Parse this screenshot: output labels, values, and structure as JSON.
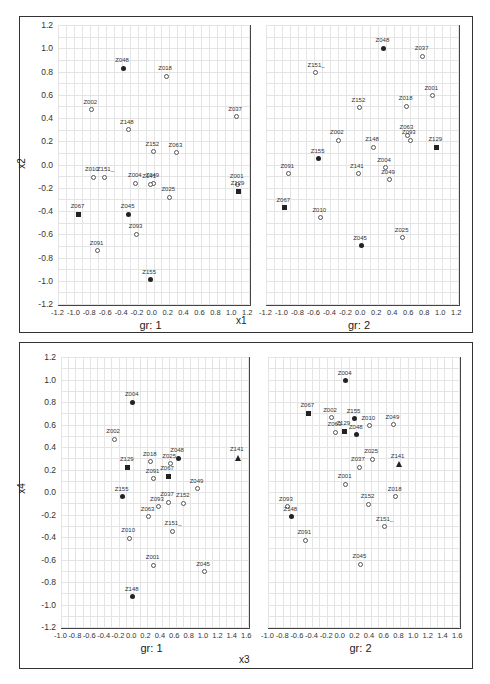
{
  "chart_data": [
    {
      "type": "scatter",
      "title": "",
      "xlabel": "x1",
      "ylabel": "x2",
      "grid": true,
      "panels": [
        {
          "label": "gr: 1",
          "xlim": [
            -1.2,
            1.2
          ],
          "ylim": [
            -1.2,
            1.2
          ],
          "xticks": [
            "-1.2",
            "-1.0",
            "-0.8",
            "-0.6",
            "-0.4",
            "-0.2",
            "0.0",
            "0.2",
            "0.4",
            "0.6",
            "0.8",
            "1.0",
            "1.2"
          ],
          "yticks": [
            "1.2",
            "1.0",
            "0.8",
            "0.6",
            "0.4",
            "0.2",
            "0.0",
            "-0.2",
            "-0.4",
            "-0.6",
            "-0.8",
            "-1.0",
            "-1.2"
          ],
          "points": [
            {
              "name": "Z048",
              "x": -0.38,
              "y": 0.83,
              "marker": "filled"
            },
            {
              "name": "Z018",
              "x": 0.16,
              "y": 0.76,
              "marker": "open"
            },
            {
              "name": "Z002",
              "x": -0.78,
              "y": 0.47,
              "marker": "open"
            },
            {
              "name": "Z037",
              "x": 1.04,
              "y": 0.41,
              "marker": "open"
            },
            {
              "name": "Z148",
              "x": -0.32,
              "y": 0.3,
              "marker": "open"
            },
            {
              "name": "Z152",
              "x": 0.0,
              "y": 0.11,
              "marker": "open"
            },
            {
              "name": "Z063",
              "x": 0.29,
              "y": 0.1,
              "marker": "open"
            },
            {
              "name": "Z010",
              "x": -0.76,
              "y": -0.11,
              "marker": "open"
            },
            {
              "name": "Z151_",
              "x": -0.61,
              "y": -0.11,
              "marker": "open"
            },
            {
              "name": "Z004",
              "x": -0.22,
              "y": -0.16,
              "marker": "open"
            },
            {
              "name": "Z049",
              "x": 0.0,
              "y": -0.16,
              "marker": "open"
            },
            {
              "name": "Z141",
              "x": -0.04,
              "y": -0.17,
              "marker": "open"
            },
            {
              "name": "Z025",
              "x": 0.2,
              "y": -0.28,
              "marker": "open"
            },
            {
              "name": "Z001",
              "x": 1.06,
              "y": -0.17,
              "marker": "open"
            },
            {
              "name": "Z129",
              "x": 1.07,
              "y": -0.23,
              "marker": "square"
            },
            {
              "name": "Z067",
              "x": -0.94,
              "y": -0.43,
              "marker": "square"
            },
            {
              "name": "Z045",
              "x": -0.31,
              "y": -0.43,
              "marker": "filled"
            },
            {
              "name": "Z093",
              "x": -0.21,
              "y": -0.6,
              "marker": "open"
            },
            {
              "name": "Z091",
              "x": -0.7,
              "y": -0.74,
              "marker": "open"
            },
            {
              "name": "Z155",
              "x": -0.04,
              "y": -0.99,
              "marker": "filled"
            }
          ]
        },
        {
          "label": "gr: 2",
          "xlim": [
            -1.2,
            1.2
          ],
          "ylim": [
            -1.2,
            1.2
          ],
          "xticks": [
            "-1.2",
            "-1.0",
            "-0.8",
            "-0.6",
            "-0.4",
            "-0.2",
            "0.0",
            "0.2",
            "0.4",
            "0.6",
            "0.8",
            "1.0",
            "1.2"
          ],
          "points": [
            {
              "name": "Z048",
              "x": 0.27,
              "y": 1.0,
              "marker": "filled"
            },
            {
              "name": "Z037",
              "x": 0.76,
              "y": 0.93,
              "marker": "open"
            },
            {
              "name": "Z151_",
              "x": -0.58,
              "y": 0.79,
              "marker": "open"
            },
            {
              "name": "Z001",
              "x": 0.88,
              "y": 0.59,
              "marker": "open"
            },
            {
              "name": "Z152",
              "x": -0.03,
              "y": 0.49,
              "marker": "open"
            },
            {
              "name": "Z018",
              "x": 0.56,
              "y": 0.5,
              "marker": "open"
            },
            {
              "name": "Z063",
              "x": 0.57,
              "y": 0.25,
              "marker": "open"
            },
            {
              "name": "Z093",
              "x": 0.6,
              "y": 0.21,
              "marker": "open"
            },
            {
              "name": "Z002",
              "x": -0.3,
              "y": 0.21,
              "marker": "open"
            },
            {
              "name": "Z148",
              "x": 0.14,
              "y": 0.15,
              "marker": "open"
            },
            {
              "name": "Z129",
              "x": 0.93,
              "y": 0.15,
              "marker": "square"
            },
            {
              "name": "Z155",
              "x": -0.54,
              "y": 0.05,
              "marker": "filled"
            },
            {
              "name": "Z091",
              "x": -0.92,
              "y": -0.08,
              "marker": "open"
            },
            {
              "name": "Z141",
              "x": -0.05,
              "y": -0.08,
              "marker": "open"
            },
            {
              "name": "Z004",
              "x": 0.29,
              "y": -0.03,
              "marker": "open"
            },
            {
              "name": "Z049",
              "x": 0.34,
              "y": -0.13,
              "marker": "open"
            },
            {
              "name": "Z067",
              "x": -0.97,
              "y": -0.37,
              "marker": "square"
            },
            {
              "name": "Z010",
              "x": -0.52,
              "y": -0.46,
              "marker": "open"
            },
            {
              "name": "Z025",
              "x": 0.51,
              "y": -0.63,
              "marker": "open"
            },
            {
              "name": "Z045",
              "x": -0.01,
              "y": -0.7,
              "marker": "filled"
            }
          ]
        }
      ]
    },
    {
      "type": "scatter",
      "title": "",
      "xlabel": "x3",
      "ylabel": "x4",
      "grid": true,
      "panels": [
        {
          "label": "gr: 1",
          "xlim": [
            -1.0,
            1.6
          ],
          "ylim": [
            -1.2,
            1.2
          ],
          "xticks": [
            "-1.0",
            "-0.8",
            "-0.6",
            "-0.4",
            "-0.2",
            "0.0",
            "0.2",
            "0.4",
            "0.6",
            "0.8",
            "1.0",
            "1.2",
            "1.4",
            "1.6"
          ],
          "yticks": [
            "1.2",
            "1.0",
            "0.8",
            "0.6",
            "0.4",
            "0.2",
            "0.0",
            "-0.2",
            "-0.4",
            "-0.6",
            "-0.8",
            "-1.0",
            "-1.2"
          ],
          "points": [
            {
              "name": "Z004",
              "x": 0.0,
              "y": 0.8,
              "marker": "filled"
            },
            {
              "name": "Z002",
              "x": -0.26,
              "y": 0.47,
              "marker": "open"
            },
            {
              "name": "Z141",
              "x": 1.46,
              "y": 0.31,
              "marker": "triangle"
            },
            {
              "name": "Z048",
              "x": 0.63,
              "y": 0.3,
              "marker": "filled"
            },
            {
              "name": "Z018",
              "x": 0.25,
              "y": 0.27,
              "marker": "open"
            },
            {
              "name": "Z025",
              "x": 0.52,
              "y": 0.25,
              "marker": "open"
            },
            {
              "name": "Z129",
              "x": -0.07,
              "y": 0.22,
              "marker": "square"
            },
            {
              "name": "Z067",
              "x": 0.49,
              "y": 0.14,
              "marker": "square"
            },
            {
              "name": "Z091",
              "x": 0.29,
              "y": 0.12,
              "marker": "open"
            },
            {
              "name": "Z049",
              "x": 0.9,
              "y": 0.03,
              "marker": "open"
            },
            {
              "name": "Z155",
              "x": -0.14,
              "y": -0.04,
              "marker": "filled"
            },
            {
              "name": "Z037",
              "x": 0.49,
              "y": -0.09,
              "marker": "open"
            },
            {
              "name": "Z152",
              "x": 0.71,
              "y": -0.1,
              "marker": "open"
            },
            {
              "name": "Z093",
              "x": 0.35,
              "y": -0.13,
              "marker": "open"
            },
            {
              "name": "Z063",
              "x": 0.22,
              "y": -0.22,
              "marker": "open"
            },
            {
              "name": "Z151_",
              "x": 0.55,
              "y": -0.35,
              "marker": "open"
            },
            {
              "name": "Z010",
              "x": -0.05,
              "y": -0.41,
              "marker": "open"
            },
            {
              "name": "Z001",
              "x": 0.29,
              "y": -0.65,
              "marker": "open"
            },
            {
              "name": "Z045",
              "x": 0.99,
              "y": -0.71,
              "marker": "open"
            },
            {
              "name": "Z148",
              "x": 0.0,
              "y": -0.93,
              "marker": "filled"
            }
          ]
        },
        {
          "label": "gr: 2",
          "xlim": [
            -1.0,
            1.6
          ],
          "ylim": [
            -1.2,
            1.2
          ],
          "xticks": [
            "-1.0",
            "-0.8",
            "-0.6",
            "-0.4",
            "-0.2",
            "0.0",
            "0.2",
            "0.4",
            "0.6",
            "0.8",
            "1.0",
            "1.2",
            "1.4",
            "1.6"
          ],
          "points": [
            {
              "name": "Z004",
              "x": 0.06,
              "y": 0.99,
              "marker": "filled"
            },
            {
              "name": "Z067",
              "x": -0.45,
              "y": 0.7,
              "marker": "square"
            },
            {
              "name": "Z002",
              "x": -0.14,
              "y": 0.66,
              "marker": "open"
            },
            {
              "name": "Z155",
              "x": 0.18,
              "y": 0.65,
              "marker": "filled"
            },
            {
              "name": "Z010",
              "x": 0.38,
              "y": 0.59,
              "marker": "open"
            },
            {
              "name": "Z049",
              "x": 0.71,
              "y": 0.6,
              "marker": "open"
            },
            {
              "name": "Z129",
              "x": 0.04,
              "y": 0.54,
              "marker": "square"
            },
            {
              "name": "Z063",
              "x": -0.08,
              "y": 0.53,
              "marker": "open"
            },
            {
              "name": "Z048",
              "x": 0.21,
              "y": 0.51,
              "marker": "filled"
            },
            {
              "name": "Z025",
              "x": 0.42,
              "y": 0.29,
              "marker": "open"
            },
            {
              "name": "Z141",
              "x": 0.78,
              "y": 0.25,
              "marker": "triangle"
            },
            {
              "name": "Z037",
              "x": 0.24,
              "y": 0.22,
              "marker": "open"
            },
            {
              "name": "Z001",
              "x": 0.06,
              "y": 0.07,
              "marker": "open"
            },
            {
              "name": "Z018",
              "x": 0.74,
              "y": -0.04,
              "marker": "open"
            },
            {
              "name": "Z152",
              "x": 0.37,
              "y": -0.11,
              "marker": "open"
            },
            {
              "name": "Z093",
              "x": -0.74,
              "y": -0.13,
              "marker": "open"
            },
            {
              "name": "Z148",
              "x": -0.68,
              "y": -0.22,
              "marker": "filled"
            },
            {
              "name": "Z151_",
              "x": 0.58,
              "y": -0.31,
              "marker": "open"
            },
            {
              "name": "Z091",
              "x": -0.49,
              "y": -0.43,
              "marker": "open"
            },
            {
              "name": "Z045",
              "x": 0.26,
              "y": -0.64,
              "marker": "open"
            }
          ]
        }
      ]
    }
  ],
  "figures": [
    {
      "xlabel": "x1",
      "ylabel": "x2",
      "panel_labels": [
        "gr: 1",
        "gr: 2"
      ]
    },
    {
      "xlabel": "x3",
      "ylabel": "x4",
      "panel_labels": [
        "gr: 1",
        "gr: 2"
      ]
    }
  ]
}
